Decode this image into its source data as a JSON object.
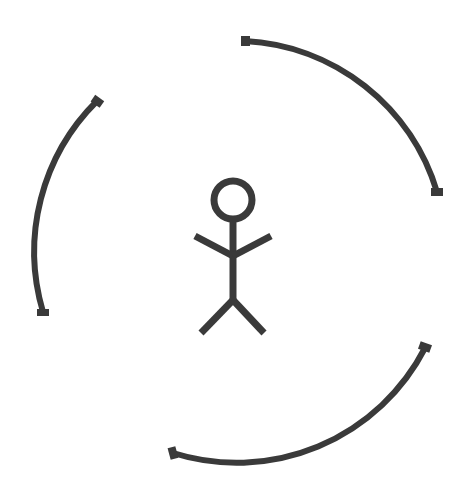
{
  "diagram": {
    "colors": {
      "background": "#ffffff",
      "stroke": "#3a3a3a"
    },
    "figure": {
      "name": "stick-figure",
      "head": {
        "cx": 233,
        "cy": 200,
        "r": 19
      },
      "body": {
        "x1": 233,
        "y1": 219,
        "x2": 233,
        "y2": 300
      },
      "left_arm": {
        "x1": 195,
        "y1": 235,
        "x2": 233,
        "y2": 255
      },
      "right_arm": {
        "x1": 271,
        "y1": 235,
        "x2": 233,
        "y2": 255
      },
      "left_leg": {
        "x1": 233,
        "y1": 300,
        "x2": 201,
        "y2": 333
      },
      "right_leg": {
        "x1": 233,
        "y1": 300,
        "x2": 264,
        "y2": 333
      }
    },
    "arcs": [
      {
        "name": "arc-top-right",
        "start": [
          245,
          41
        ],
        "end": [
          437,
          192
        ],
        "r": 212
      },
      {
        "name": "arc-bottom-right",
        "start": [
          425,
          348
        ],
        "end": [
          173,
          453
        ],
        "r": 212
      },
      {
        "name": "arc-left",
        "start": [
          97,
          101
        ],
        "end": [
          43,
          312
        ],
        "r": 212
      }
    ]
  }
}
